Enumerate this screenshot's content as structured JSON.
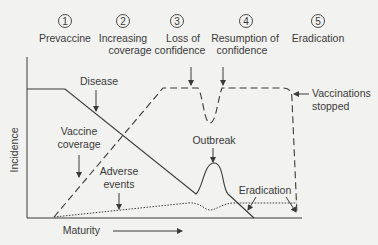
{
  "stages": [
    {
      "number": "1",
      "label_lines": [
        "Prevaccine"
      ]
    },
    {
      "number": "2",
      "label_lines": [
        "Increasing",
        "coverage"
      ]
    },
    {
      "number": "3",
      "label_lines": [
        "Loss of",
        "confidence"
      ]
    },
    {
      "number": "4",
      "label_lines": [
        "Resumption of",
        "confidence"
      ]
    },
    {
      "number": "5",
      "label_lines": [
        "Eradication"
      ]
    }
  ],
  "axes": {
    "y_label": "Incidence",
    "x_label": "Maturity"
  },
  "annotations": {
    "disease": "Disease",
    "vaccine_coverage_line1": "Vaccine",
    "vaccine_coverage_line2": "coverage",
    "adverse_events_line1": "Adverse",
    "adverse_events_line2": "events",
    "outbreak": "Outbreak",
    "eradication": "Eradication",
    "vaccinations_stopped_line1": "Vaccinations",
    "vaccinations_stopped_line2": "stopped"
  },
  "colors": {
    "background": "#f2f2f0",
    "line": "#3a3a3a"
  }
}
